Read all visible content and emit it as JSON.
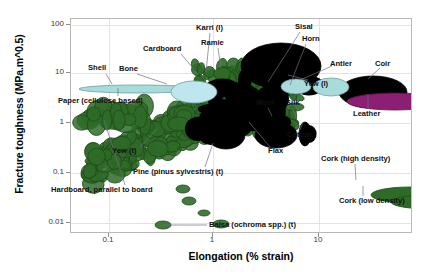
{
  "chart_data": {
    "type": "scatter",
    "title": "",
    "xlabel": "Elongation (% strain)",
    "ylabel": "Fracture toughness (MPa.m^0.5)",
    "xscale": "log",
    "yscale": "log",
    "xlim": [
      0.05,
      40
    ],
    "ylim": [
      0.006,
      200
    ],
    "xticks": [
      "0.1",
      "1",
      "10"
    ],
    "yticks": [
      "100",
      "10",
      "1",
      "0.1",
      "0.01"
    ],
    "grid": true,
    "legend": "none",
    "colors": {
      "wood_green": "#2f6b28",
      "protein_black": "#000000",
      "shell_teal": "#a8dcdc",
      "bone_blue": "#bfe6ef",
      "leather_purple": "#8a1f73",
      "grid": "#e3e3e3",
      "frame": "#b9b9b9",
      "leader": "#6f6f86"
    },
    "annotations": [
      {
        "label": "Shell",
        "x": 0.175,
        "y": 4.6,
        "color": "shell_teal"
      },
      {
        "label": "Paper (cellulose based)",
        "x": 0.175,
        "y": 4.2,
        "color": "shell_teal"
      },
      {
        "label": "Cardboard",
        "x": 1.25,
        "y": 6.2,
        "color": "bone_blue"
      },
      {
        "label": "Bone",
        "x": 1.25,
        "y": 6.2,
        "color": "bone_blue"
      },
      {
        "label": "Karri (l)",
        "x": 2.6,
        "y": 20.0,
        "color": "protein_black"
      },
      {
        "label": "Ramie",
        "x": 1.55,
        "y": 9.0,
        "color": "protein_black"
      },
      {
        "label": "Sisal",
        "x": 3.2,
        "y": 6.0,
        "color": "shell_teal"
      },
      {
        "label": "Horn",
        "x": 4.0,
        "y": 5.6,
        "color": "shell_teal"
      },
      {
        "label": "Antler",
        "x": 4.0,
        "y": 5.6,
        "color": "shell_teal"
      },
      {
        "label": "Yew (l)",
        "x": 3.1,
        "y": 3.6,
        "color": "wood_green"
      },
      {
        "label": "Coir",
        "x": 10.5,
        "y": 4.3,
        "color": "protein_black"
      },
      {
        "label": "Leather",
        "x": 13.0,
        "y": 2.6,
        "color": "leather_purple"
      },
      {
        "label": "Wool",
        "x": 3.0,
        "y": 1.5,
        "color": "protein_black"
      },
      {
        "label": "Silk",
        "x": 3.9,
        "y": 1.5,
        "color": "protein_black"
      },
      {
        "label": "Cotton",
        "x": 4.6,
        "y": 1.4,
        "color": "protein_black"
      },
      {
        "label": "Flax",
        "x": 1.5,
        "y": 1.5,
        "color": "protein_black"
      },
      {
        "label": "Yew (t)",
        "x": 0.62,
        "y": 0.55,
        "color": "wood_green"
      },
      {
        "label": "Pine (pinus sylvestris) (t)",
        "x": 1.5,
        "y": 0.42,
        "color": "wood_green"
      },
      {
        "label": "Hardboard, parallel to board",
        "x": 0.19,
        "y": 0.95,
        "color": "wood_green"
      },
      {
        "label": "Cork (high density)",
        "x": 11.0,
        "y": 0.1,
        "color": "wood_green"
      },
      {
        "label": "Cork (low density)",
        "x": 12.5,
        "y": 0.085,
        "color": "wood_green"
      },
      {
        "label": "Balsa (ochroma spp.) (t)",
        "x": 1.1,
        "y": 0.012,
        "color": "wood_green"
      }
    ]
  },
  "axes": {
    "y_title": "Fracture toughness (MPa.m^0.5)",
    "x_title": "Elongation (% strain)",
    "y_ticks": [
      {
        "label": "100",
        "top": 24
      },
      {
        "label": "10",
        "top": 72
      },
      {
        "label": "1",
        "top": 122
      },
      {
        "label": "0.1",
        "top": 172
      },
      {
        "label": "0.01",
        "top": 222
      }
    ],
    "x_ticks": [
      {
        "label": "0.1",
        "left": 108
      },
      {
        "label": "1",
        "left": 212
      },
      {
        "label": "10",
        "left": 318
      }
    ]
  },
  "labels": [
    {
      "name": "shell",
      "text": "Shell",
      "left": 88,
      "top": 64,
      "leader": {
        "x1": 106,
        "y1": 74,
        "x2": 112,
        "y2": 84
      }
    },
    {
      "name": "paper",
      "text": "Paper (cellulose based)",
      "left": 58,
      "top": 97,
      "leader": {
        "x1": 118,
        "y1": 96,
        "x2": 118,
        "y2": 88
      }
    },
    {
      "name": "cardboard",
      "text": "Cardboard",
      "left": 143,
      "top": 45,
      "leader": {
        "x1": 181,
        "y1": 54,
        "x2": 198,
        "y2": 74
      }
    },
    {
      "name": "bone",
      "text": "Bone",
      "left": 119,
      "top": 65,
      "leader": {
        "x1": 137,
        "y1": 74,
        "x2": 167,
        "y2": 84
      }
    },
    {
      "name": "karri",
      "text": "Karri (l)",
      "left": 196,
      "top": 24,
      "leader": {
        "x1": 210,
        "y1": 33,
        "x2": 206,
        "y2": 72
      }
    },
    {
      "name": "ramie",
      "text": "Ramie",
      "left": 201,
      "top": 39,
      "leader": {
        "x1": 218,
        "y1": 48,
        "x2": 221,
        "y2": 68
      }
    },
    {
      "name": "sisal",
      "text": "Sisal",
      "left": 295,
      "top": 23,
      "leader": {
        "x1": 300,
        "y1": 32,
        "x2": 268,
        "y2": 82
      }
    },
    {
      "name": "horn",
      "text": "Horn",
      "left": 302,
      "top": 35,
      "leader": {
        "x1": 306,
        "y1": 44,
        "x2": 290,
        "y2": 85
      }
    },
    {
      "name": "antler",
      "text": "Antler",
      "left": 330,
      "top": 60,
      "leader": {
        "x1": 332,
        "y1": 66,
        "x2": 300,
        "y2": 80
      }
    },
    {
      "name": "coir",
      "text": "Coir",
      "left": 375,
      "top": 60,
      "leader": {
        "x1": 380,
        "y1": 68,
        "x2": 368,
        "y2": 79
      }
    },
    {
      "name": "yew-l",
      "text": "Yew (l)",
      "left": 304,
      "top": 80,
      "leader": {
        "x1": 308,
        "y1": 80,
        "x2": 288,
        "y2": 75
      }
    },
    {
      "name": "leather",
      "text": "Leather",
      "left": 353,
      "top": 110,
      "leader": {
        "x1": 368,
        "y1": 109,
        "x2": 368,
        "y2": 94
      }
    },
    {
      "name": "wool",
      "text": "Wool",
      "left": 256,
      "top": 99,
      "leader": {
        "x1": 268,
        "y1": 108,
        "x2": 272,
        "y2": 116
      }
    },
    {
      "name": "silk",
      "text": "Silk",
      "left": 286,
      "top": 99,
      "leader": {
        "x1": 292,
        "y1": 108,
        "x2": 296,
        "y2": 116
      }
    },
    {
      "name": "cotton",
      "text": "Cotton",
      "left": 287,
      "top": 131,
      "leader": {
        "x1": 300,
        "y1": 130,
        "x2": 303,
        "y2": 122
      }
    },
    {
      "name": "flax",
      "text": "Flax",
      "left": 268,
      "top": 147,
      "leader": {
        "x1": 270,
        "y1": 147,
        "x2": 249,
        "y2": 122
      }
    },
    {
      "name": "yew-t",
      "text": "Yew (t)",
      "left": 112,
      "top": 147,
      "leader": {
        "x1": 140,
        "y1": 147,
        "x2": 157,
        "y2": 129
      }
    },
    {
      "name": "pine",
      "text": "Pine (pinus sylvestris) (t)",
      "left": 133,
      "top": 168,
      "leader": {
        "x1": 205,
        "y1": 167,
        "x2": 213,
        "y2": 143
      }
    },
    {
      "name": "hardboard",
      "text": "Hardboard, parallel to board",
      "left": 51,
      "top": 186,
      "leader": {
        "x1": 125,
        "y1": 185,
        "x2": 104,
        "y2": 120
      }
    },
    {
      "name": "cork-high",
      "text": "Cork (high density)",
      "left": 321,
      "top": 155,
      "leader": {
        "x1": 355,
        "y1": 164,
        "x2": 356,
        "y2": 180
      }
    },
    {
      "name": "cork-low",
      "text": "Cork (low density)",
      "left": 339,
      "top": 197,
      "leader": {
        "x1": 363,
        "y1": 196,
        "x2": 363,
        "y2": 186
      }
    },
    {
      "name": "balsa",
      "text": "Balsa (ochroma spp.) (t)",
      "left": 209,
      "top": 221,
      "leader": {
        "x1": 207,
        "y1": 225,
        "x2": 163,
        "y2": 225
      }
    }
  ],
  "bubbles": {
    "shell": {
      "left": 8,
      "top": 66,
      "w": 118,
      "h": 8,
      "fill": "#a8dcdc",
      "stroke": "#6f9d9d"
    },
    "bone": {
      "left": 100,
      "top": 62,
      "w": 46,
      "h": 22,
      "fill": "#bfe6ef",
      "stroke": "#6f9d9d"
    },
    "karri": {
      "left": 170,
      "top": 24,
      "w": 80,
      "h": 46,
      "fill": "#000000",
      "stroke": "#000000"
    },
    "coir": {
      "left": 268,
      "top": 57,
      "w": 68,
      "h": 32,
      "fill": "#000000",
      "stroke": "#000000"
    },
    "leather": {
      "left": 276,
      "top": 74,
      "w": 96,
      "h": 17,
      "fill": "#8a1f73",
      "stroke": "#5a1049"
    },
    "sisal": {
      "left": 210,
      "top": 60,
      "w": 30,
      "h": 15,
      "fill": "#a8dcdc",
      "stroke": "#6f9d9d"
    },
    "horn": {
      "left": 242,
      "top": 59,
      "w": 36,
      "h": 18,
      "fill": "#a8dcdc",
      "stroke": "#6f9d9d"
    },
    "wool": {
      "left": 184,
      "top": 103,
      "w": 42,
      "h": 26,
      "fill": "#000000",
      "stroke": "#000000"
    },
    "silk": {
      "left": 228,
      "top": 103,
      "w": 12,
      "h": 24,
      "fill": "#000000",
      "stroke": "#000000"
    },
    "flax": {
      "left": 136,
      "top": 102,
      "w": 38,
      "h": 28,
      "fill": "#000000",
      "stroke": "#000000"
    },
    "cork_high": {
      "left": 300,
      "top": 168,
      "w": 78,
      "h": 16,
      "fill": "#2f6b28",
      "stroke": "#1d4a18"
    },
    "cork_low": {
      "left": 320,
      "top": 176,
      "w": 78,
      "h": 14,
      "fill": "#2f6b28",
      "stroke": "#1d4a18"
    }
  }
}
